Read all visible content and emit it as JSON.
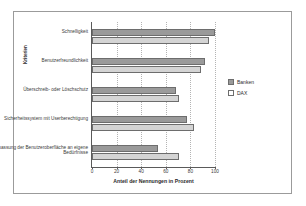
{
  "chart_data": {
    "type": "bar",
    "orientation": "horizontal",
    "title": "",
    "xlabel": "Anteil der Nennungen in Prozent",
    "ylabel": "Kriterien",
    "xlim": [
      0,
      100
    ],
    "xticks": [
      0,
      20,
      40,
      60,
      80,
      100
    ],
    "grid": true,
    "legend_position": "right",
    "categories": [
      "Schnelligkeit",
      "Benutzerfreundlichkeit",
      "Überschreib- oder Löschschutz",
      "Sicherheitssystem mit Userberechtigung",
      "Anpassung der Benutzeroberfläche an eigene Bedürfnisse"
    ],
    "series": [
      {
        "name": "Banken",
        "color": "#9a9a9a",
        "values": [
          100,
          92,
          68,
          77,
          54
        ]
      },
      {
        "name": "DAX",
        "color": "#d4d4d4",
        "values": [
          95,
          89,
          71,
          83,
          71
        ]
      }
    ]
  },
  "legend": {
    "items": [
      {
        "label": "Banken",
        "swatch": "banken"
      },
      {
        "label": "DAX",
        "swatch": "dax"
      }
    ]
  }
}
